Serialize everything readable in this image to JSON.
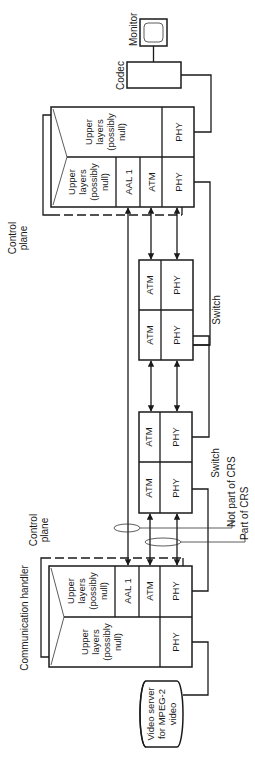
{
  "diagram": {
    "orientation": "rotated-90-ccw",
    "labels": {
      "monitor": "Monitor",
      "codec": "Codec",
      "control_plane_top_1": "Control",
      "control_plane_top_2": "plane",
      "control_plane_bottom_1": "Control",
      "control_plane_bottom_2": "plane",
      "switch_upper": "Switch",
      "switch_lower": "Switch",
      "not_part_of_crs": "Not part of CRS",
      "part_of_crs": "Part of CRS",
      "communication_handler": "Communication handler",
      "video_server_1": "Video server",
      "video_server_2": "for MPEG-2",
      "video_server_3": "video"
    },
    "top_terminal": {
      "left_stack": {
        "upper_1": "Upper",
        "upper_2": "layers",
        "upper_3": "(possibly",
        "upper_4": "null)",
        "aal": "AAL 1",
        "atm": "ATM",
        "phy": "PHY"
      },
      "right_stack": {
        "upper_1": "Upper",
        "upper_2": "layers",
        "upper_3": "(possibly",
        "upper_4": "null)",
        "phy": "PHY"
      }
    },
    "switch_upper": {
      "cells": [
        "ATM",
        "PHY",
        "ATM",
        "PHY"
      ]
    },
    "switch_lower": {
      "cells": [
        "ATM",
        "PHY",
        "ATM",
        "PHY"
      ]
    },
    "communication_handler": {
      "network_stack": {
        "upper_1": "Upper",
        "upper_2": "layers",
        "upper_3": "(possibly",
        "upper_4": "null)",
        "aal": "AAL 1",
        "atm": "ATM",
        "phy": "PHY"
      },
      "server_stack": {
        "upper_1": "Upper",
        "upper_2": "layers",
        "upper_3": "(possibly",
        "upper_4": "null)",
        "phy": "PHY"
      }
    }
  }
}
